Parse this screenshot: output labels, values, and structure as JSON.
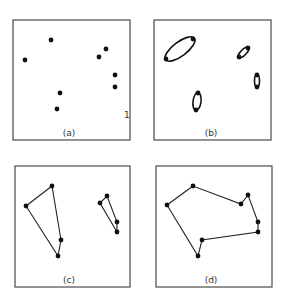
{
  "panels": [
    {
      "id": "a",
      "label": "(a)",
      "box": {
        "x": 13,
        "y": 20,
        "w": 117,
        "h": 120
      },
      "label_pos": {
        "x": 69,
        "y": 136
      },
      "points": [
        [
          51,
          40
        ],
        [
          25,
          60
        ],
        [
          99,
          57
        ],
        [
          106,
          49
        ],
        [
          115,
          75
        ],
        [
          115,
          87
        ],
        [
          60,
          93
        ],
        [
          57,
          109
        ]
      ],
      "mark": {
        "text": "1",
        "x": 124,
        "y": 118
      }
    },
    {
      "id": "b",
      "label": "(b)",
      "box": {
        "x": 154,
        "y": 20,
        "w": 117,
        "h": 120
      },
      "label_pos": {
        "x": 211,
        "y": 136
      },
      "ellipses": [
        {
          "cx": 180,
          "cy": 49,
          "rx": 18,
          "ry": 7,
          "rot": -37,
          "ends": [
            [
              166,
              59
            ],
            [
              193,
              39
            ]
          ]
        },
        {
          "cx": 243.5,
          "cy": 52.5,
          "rx": 7,
          "ry": 2.8,
          "rot": -45,
          "ends": [
            [
              239,
              57
            ],
            [
              248,
              48
            ]
          ]
        },
        {
          "cx": 257,
          "cy": 81,
          "rx": 2.5,
          "ry": 6.5,
          "rot": 0,
          "ends": [
            [
              257,
              75
            ],
            [
              257,
              87
            ]
          ]
        },
        {
          "cx": 197,
          "cy": 101.5,
          "rx": 4,
          "ry": 9,
          "rot": 7,
          "ends": [
            [
              198,
              93
            ],
            [
              196,
              110
            ]
          ]
        }
      ]
    },
    {
      "id": "c",
      "label": "(c)",
      "box": {
        "x": 15,
        "y": 166,
        "w": 115,
        "h": 121
      },
      "label_pos": {
        "x": 69,
        "y": 283
      },
      "polygons": [
        [
          [
            52,
            186
          ],
          [
            26,
            206
          ],
          [
            58,
            256
          ],
          [
            61,
            240
          ]
        ],
        [
          [
            107,
            196
          ],
          [
            100,
            203
          ],
          [
            117,
            232
          ],
          [
            117,
            222
          ]
        ]
      ]
    },
    {
      "id": "d",
      "label": "(d)",
      "box": {
        "x": 156,
        "y": 166,
        "w": 116,
        "h": 121
      },
      "label_pos": {
        "x": 211,
        "y": 283
      },
      "polygons": [
        [
          [
            193,
            186
          ],
          [
            167,
            205
          ],
          [
            198,
            256
          ],
          [
            202,
            240
          ],
          [
            258,
            232
          ],
          [
            258,
            222
          ],
          [
            248,
            195
          ],
          [
            241,
            204
          ]
        ]
      ]
    }
  ]
}
